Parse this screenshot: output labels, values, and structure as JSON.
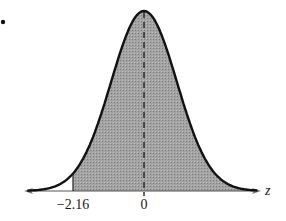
{
  "chart_data": {
    "type": "area",
    "title": "",
    "xlabel": "z",
    "ylabel": "",
    "distribution": "standard normal",
    "mean": 0,
    "sd": 1,
    "shaded_region": {
      "from": -2.16,
      "to": "infinity"
    },
    "tick_labels": [
      "-2.16",
      "0"
    ],
    "ticks": [
      -2.16,
      0
    ],
    "reference_line": {
      "x": 0,
      "style": "dashed"
    },
    "xlim": [
      -3.1,
      3.1
    ],
    "grid": false,
    "legend": null
  },
  "labels": {
    "tick_left": "−2.16",
    "tick_mean": "0",
    "axis": "z"
  },
  "colors": {
    "curve": "#111111",
    "fill": "#9a9a9a",
    "axis": "#444444",
    "background": "#ffffff"
  }
}
